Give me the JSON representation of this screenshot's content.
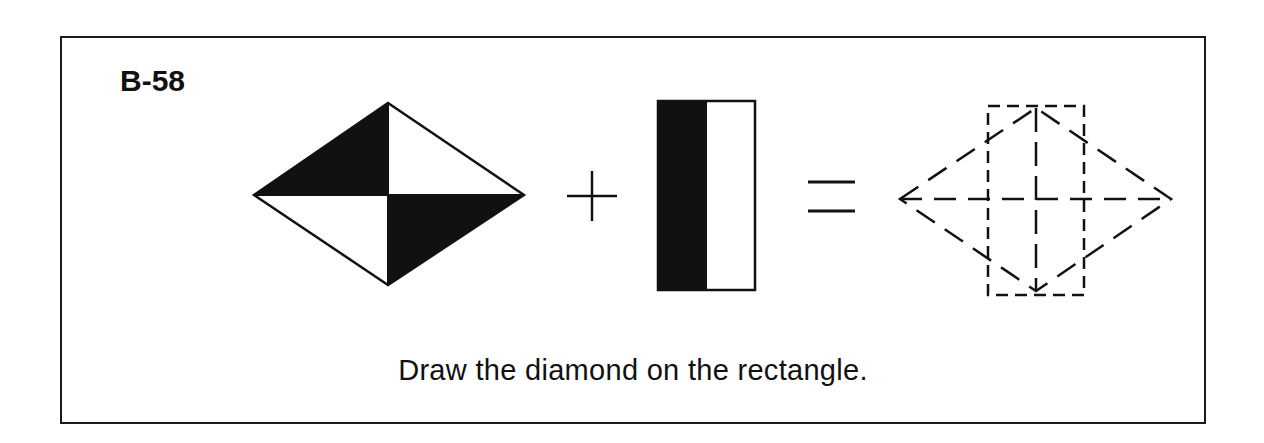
{
  "worksheet": {
    "problem_id": "B-58",
    "instruction": "Draw the diamond on the rectangle.",
    "equation": {
      "operand_1": "diamond-quartered-black-white",
      "operator_1": "plus",
      "operand_2": "rectangle-half-black-half-white",
      "operator_2": "equals",
      "result": "dashed-diamond-overlaid-on-dashed-rectangle"
    },
    "colors": {
      "ink": "#111111",
      "paper": "#ffffff"
    }
  }
}
